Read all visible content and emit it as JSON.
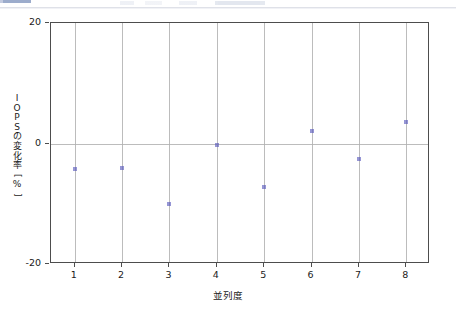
{
  "chrome": {
    "tab_accent_color": "#8b9dc3",
    "divider_color": "#dfe1e8"
  },
  "figure": {
    "background": "#ffffff",
    "axes_color": "#4d4d4d",
    "grid_color": "#b0b0b0",
    "marker_color": "#5555bb"
  },
  "chart_data": {
    "type": "scatter",
    "title": "",
    "xlabel": "並列度",
    "ylabel": "IOPSの変化率[%]",
    "ylabel_chars": [
      "I",
      "O",
      "P",
      "S",
      "の",
      "変",
      "化",
      "率",
      "[",
      "%",
      "]"
    ],
    "x": [
      1,
      2,
      3,
      4,
      5,
      6,
      7,
      8
    ],
    "values": [
      -4.3,
      -4.0,
      -10.0,
      -0.2,
      -7.3,
      2.0,
      -2.5,
      3.5
    ],
    "series": [
      {
        "name": "IOPSの変化率",
        "values": [
          -4.3,
          -4.0,
          -10.0,
          -0.2,
          -7.3,
          2.0,
          -2.5,
          3.5
        ]
      }
    ],
    "xticks": [
      1,
      2,
      3,
      4,
      5,
      6,
      7,
      8
    ],
    "xticklabels": [
      "1",
      "2",
      "3",
      "4",
      "5",
      "6",
      "7",
      "8"
    ],
    "yticks": [
      20,
      0,
      -20
    ],
    "yticklabels": [
      "20",
      "0",
      "-20"
    ],
    "xlim": [
      0.5,
      8.5
    ],
    "ylim": [
      -20,
      20
    ],
    "grid": "vertical-at-xticks-plus-zero-line",
    "legend": "none",
    "marker": "small-square-dot"
  }
}
